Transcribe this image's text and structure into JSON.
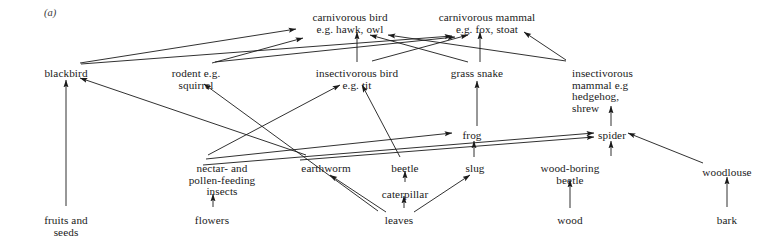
{
  "figure": {
    "panel_label": "(a)",
    "caption": "",
    "line_color": "#1a1a1a",
    "background_color": "#ffffff",
    "text_color": "#1a1a1a"
  },
  "nodes": [
    {
      "id": "carnivorous_bird",
      "label": "carnivorous bird\ne.g. hawk, owl",
      "x": 350,
      "y": 12,
      "align": "center"
    },
    {
      "id": "carnivorous_mammal",
      "label": "carnivorous mammal\ne.g. fox, stoat",
      "x": 487,
      "y": 12,
      "align": "center"
    },
    {
      "id": "blackbird",
      "label": "blackbird",
      "x": 66,
      "y": 68,
      "align": "center"
    },
    {
      "id": "rodent",
      "label": "rodent e.g.\nsquirrel",
      "x": 196,
      "y": 68,
      "align": "center"
    },
    {
      "id": "insectivorous_bird",
      "label": "insectivorous bird\ne.g. tit",
      "x": 357,
      "y": 68,
      "align": "center"
    },
    {
      "id": "grass_snake",
      "label": "grass snake",
      "x": 477,
      "y": 68,
      "align": "center"
    },
    {
      "id": "insectivorous_mammal",
      "label": "insectivorous\nmammal e.g\nhedgehog,\nshrew",
      "x": 572,
      "y": 68,
      "align": "left"
    },
    {
      "id": "frog",
      "label": "frog",
      "x": 472,
      "y": 130,
      "align": "center"
    },
    {
      "id": "spider",
      "label": "spider",
      "x": 612,
      "y": 130,
      "align": "center"
    },
    {
      "id": "woodlouse",
      "label": "woodlouse",
      "x": 727,
      "y": 167,
      "align": "center"
    },
    {
      "id": "nectar_pollen_insects",
      "label": "nectar- and\npollen-feeding\ninsects",
      "x": 222,
      "y": 163,
      "align": "center"
    },
    {
      "id": "earthworm",
      "label": "earthworm",
      "x": 326,
      "y": 163,
      "align": "center"
    },
    {
      "id": "beetle",
      "label": "beetle",
      "x": 405,
      "y": 163,
      "align": "center"
    },
    {
      "id": "slug",
      "label": "slug",
      "x": 475,
      "y": 163,
      "align": "center"
    },
    {
      "id": "wood_boring_beetle",
      "label": "wood-boring\nbeetle",
      "x": 570,
      "y": 163,
      "align": "center"
    },
    {
      "id": "caterpillar",
      "label": "caterpillar",
      "x": 405,
      "y": 189,
      "align": "center"
    },
    {
      "id": "fruits_and_seeds",
      "label": "fruits and\nseeds",
      "x": 66,
      "y": 215,
      "align": "center"
    },
    {
      "id": "flowers",
      "label": "flowers",
      "x": 212,
      "y": 215,
      "align": "center"
    },
    {
      "id": "leaves",
      "label": "leaves",
      "x": 399,
      "y": 215,
      "align": "center"
    },
    {
      "id": "wood",
      "label": "wood",
      "x": 570,
      "y": 215,
      "align": "center"
    },
    {
      "id": "bark",
      "label": "bark",
      "x": 727,
      "y": 215,
      "align": "center"
    }
  ],
  "edges": [
    {
      "from": "fruits_and_seeds",
      "to": "blackbird"
    },
    {
      "from": "leaves",
      "to": "earthworm"
    },
    {
      "from": "leaves",
      "to": "caterpillar"
    },
    {
      "from": "leaves",
      "to": "slug"
    },
    {
      "from": "caterpillar",
      "to": "beetle"
    },
    {
      "from": "flowers",
      "to": "nectar_pollen_insects"
    },
    {
      "from": "wood",
      "to": "wood_boring_beetle"
    },
    {
      "from": "bark",
      "to": "woodlouse"
    },
    {
      "from": "slug",
      "to": "frog"
    },
    {
      "from": "frog",
      "to": "grass_snake"
    },
    {
      "from": "wood_boring_beetle",
      "to": "spider"
    },
    {
      "from": "woodlouse",
      "to": "spider"
    },
    {
      "from": "spider",
      "to": "insectivorous_mammal"
    },
    {
      "from": "nectar_pollen_insects",
      "to": "frog"
    },
    {
      "from": "nectar_pollen_insects",
      "to": "spider"
    },
    {
      "from": "earthworm",
      "to": "spider"
    },
    {
      "from": "nectar_pollen_insects",
      "to": "insectivorous_bird"
    },
    {
      "from": "earthworm",
      "to": "blackbird"
    },
    {
      "from": "beetle",
      "to": "insectivorous_bird"
    },
    {
      "from": "leaves",
      "to": "rodent"
    },
    {
      "from": "blackbird",
      "to": "carnivorous_bird"
    },
    {
      "from": "blackbird",
      "to": "carnivorous_mammal"
    },
    {
      "from": "rodent",
      "to": "carnivorous_bird"
    },
    {
      "from": "rodent",
      "to": "carnivorous_mammal"
    },
    {
      "from": "insectivorous_bird",
      "to": "carnivorous_bird"
    },
    {
      "from": "insectivorous_bird",
      "to": "carnivorous_mammal"
    },
    {
      "from": "grass_snake",
      "to": "carnivorous_bird"
    },
    {
      "from": "grass_snake",
      "to": "carnivorous_mammal"
    },
    {
      "from": "insectivorous_mammal",
      "to": "carnivorous_bird"
    },
    {
      "from": "insectivorous_mammal",
      "to": "carnivorous_mammal"
    }
  ],
  "edge_paths": {
    "fruits_and_seeds__blackbird": {
      "x1": 66,
      "y1": 206,
      "x2": 66,
      "y2": 80
    },
    "leaves__earthworm": {
      "x1": 386,
      "y1": 212,
      "x2": 330,
      "y2": 175
    },
    "leaves__caterpillar": {
      "x1": 404,
      "y1": 208,
      "x2": 404,
      "y2": 196
    },
    "leaves__slug": {
      "x1": 414,
      "y1": 212,
      "x2": 470,
      "y2": 175
    },
    "caterpillar__beetle": {
      "x1": 405,
      "y1": 182,
      "x2": 405,
      "y2": 171
    },
    "flowers__nectar_pollen_insects": {
      "x1": 213,
      "y1": 207,
      "x2": 213,
      "y2": 194
    },
    "wood__wood_boring_beetle": {
      "x1": 570,
      "y1": 208,
      "x2": 570,
      "y2": 180
    },
    "bark__woodlouse": {
      "x1": 727,
      "y1": 207,
      "x2": 727,
      "y2": 177
    },
    "slug__frog": {
      "x1": 474,
      "y1": 157,
      "x2": 474,
      "y2": 141
    },
    "frog__grass_snake": {
      "x1": 477,
      "y1": 126,
      "x2": 477,
      "y2": 81
    },
    "wood_boring_beetle__spider": {
      "x1": 611,
      "y1": 156,
      "x2": 611,
      "y2": 141
    },
    "woodlouse__spider": {
      "x1": 703,
      "y1": 163,
      "x2": 628,
      "y2": 133
    },
    "spider__insectivorous_mammal": {
      "x1": 611,
      "y1": 126,
      "x2": 611,
      "y2": 106
    },
    "nectar_pollen_insects__frog": {
      "x1": 206,
      "y1": 159,
      "x2": 452,
      "y2": 133
    },
    "nectar_pollen_insects__spider": {
      "x1": 203,
      "y1": 165,
      "x2": 594,
      "y2": 133
    },
    "earthworm__spider": {
      "x1": 300,
      "y1": 160,
      "x2": 594,
      "y2": 137
    },
    "nectar_pollen_insects__insectivorous_bird": {
      "x1": 208,
      "y1": 155,
      "x2": 340,
      "y2": 85
    },
    "earthworm__blackbird": {
      "x1": 306,
      "y1": 155,
      "x2": 80,
      "y2": 78
    },
    "beetle__insectivorous_bird": {
      "x1": 400,
      "y1": 157,
      "x2": 362,
      "y2": 85
    },
    "leaves__rodent": {
      "x1": 378,
      "y1": 211,
      "x2": 204,
      "y2": 84
    },
    "blackbird__carnivorous_bird": {
      "x1": 80,
      "y1": 63,
      "x2": 296,
      "y2": 29
    },
    "blackbird__carnivorous_mammal": {
      "x1": 81,
      "y1": 64,
      "x2": 452,
      "y2": 36
    },
    "rodent__carnivorous_bird": {
      "x1": 212,
      "y1": 63,
      "x2": 303,
      "y2": 38
    },
    "rodent__carnivorous_mammal": {
      "x1": 215,
      "y1": 62,
      "x2": 455,
      "y2": 37
    },
    "insectivorous_bird__carnivorous_bird": {
      "x1": 357,
      "y1": 62,
      "x2": 357,
      "y2": 32
    },
    "insectivorous_bird__carnivorous_mammal": {
      "x1": 372,
      "y1": 61,
      "x2": 468,
      "y2": 35
    },
    "grass_snake__carnivorous_bird": {
      "x1": 468,
      "y1": 62,
      "x2": 370,
      "y2": 35
    },
    "grass_snake__carnivorous_mammal": {
      "x1": 480,
      "y1": 62,
      "x2": 480,
      "y2": 32
    },
    "insectivorous_mammal__carnivorous_bird": {
      "x1": 566,
      "y1": 61,
      "x2": 388,
      "y2": 35
    },
    "insectivorous_mammal__carnivorous_mammal": {
      "x1": 566,
      "y1": 60,
      "x2": 524,
      "y2": 32
    }
  }
}
